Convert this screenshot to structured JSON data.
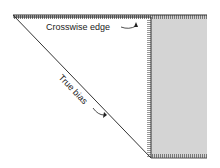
{
  "diagram": {
    "type": "fabric-bias-fold",
    "labels": {
      "crosswise": "Crosswise edge",
      "bias": "True bias"
    },
    "colors": {
      "fabric_fill": "#d4d4d4",
      "line": "#333333",
      "background": "#ffffff"
    }
  }
}
